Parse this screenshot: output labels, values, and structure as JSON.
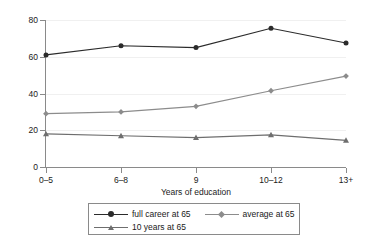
{
  "chart_data": {
    "type": "line",
    "title": "",
    "subtitle": "",
    "xlabel": "Years of education",
    "ylabel": "% of males fund at 65",
    "categories": [
      "0–5",
      "6–8",
      "9",
      "10–12",
      "13+"
    ],
    "ylim": [
      0,
      80
    ],
    "yticks": [
      0,
      20,
      40,
      60,
      80
    ],
    "ytick_labels": [
      "0",
      "20",
      "40",
      "60",
      "80"
    ],
    "grid": "horizontal-major-faint",
    "legend_position": "below-axis-boxed",
    "series": [
      {
        "name": "full career at 65",
        "values": [
          61,
          66,
          65,
          75.5,
          67.5
        ],
        "color": "#2b2b2b",
        "marker": "circle"
      },
      {
        "name": "average at 65",
        "values": [
          29,
          30,
          33,
          41.5,
          49.5
        ],
        "color": "#8c8c8c",
        "marker": "diamond"
      },
      {
        "name": "10 years at 65",
        "values": [
          18,
          17,
          16,
          17.5,
          14.5
        ],
        "color": "#6e6e6e",
        "marker": "triangle"
      }
    ]
  },
  "legend": {
    "entries": [
      {
        "label": "full career at 65"
      },
      {
        "label": "average at 65"
      },
      {
        "label": "10 years at 65"
      }
    ]
  },
  "colors": {
    "axis": "#8a8a8a",
    "grid": "#f0f0f0",
    "text": "#1a1a1a",
    "series_full_career": "#2b2b2b",
    "series_average": "#8c8c8c",
    "series_ten_years": "#6e6e6e",
    "background": "#ffffff"
  }
}
